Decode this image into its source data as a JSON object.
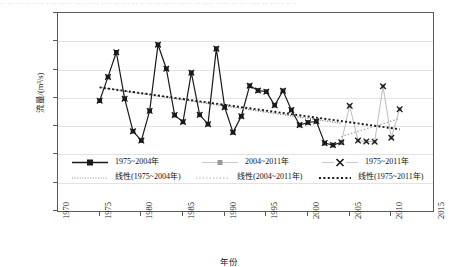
{
  "topstrip": {
    "text": "·· ·· ···  ···· ·· ···· ····· ···· ···· ···· ·· ···  ·· ·· ····· ····· ····· ·· ···· ····· ·· ··· ···· ·· ····· ·· ·"
  },
  "chart_data": {
    "type": "line",
    "title": "",
    "xlabel": "年份",
    "ylabel": "流量/(m³/s)",
    "xlim": [
      1970,
      2015
    ],
    "ylim": [
      0,
      700
    ],
    "xticks": [
      "1970",
      "1975",
      "1980",
      "1985",
      "1990",
      "1995",
      "2000",
      "2005",
      "2010",
      "2015"
    ],
    "yticks": [
      "0",
      "100",
      "200",
      "300",
      "400",
      "500",
      "600",
      "700"
    ],
    "grid": "horizontal",
    "legend_position": "inside-lower-left",
    "colors": {
      "series_1975_2004": "#1a1a1a",
      "series_2004_2011": "#9a9a9a",
      "series_1975_2011": "#1a1a1a",
      "trend_1975_2004": "#6e6e6e",
      "trend_2004_2011": "#9a9a9a",
      "trend_1975_2011": "#1a1a1a",
      "gridline": "#e3e3e3",
      "axis": "#5a5a5a"
    },
    "series": [
      {
        "name": "1975~2004年",
        "marker": "square",
        "color": "#1a1a1a",
        "x": [
          1975,
          1976,
          1977,
          1978,
          1979,
          1980,
          1981,
          1982,
          1983,
          1984,
          1985,
          1986,
          1987,
          1988,
          1989,
          1990,
          1991,
          1992,
          1993,
          1994,
          1995,
          1996,
          1997,
          1998,
          1999,
          2000,
          2001,
          2002,
          2003,
          2004
        ],
        "values": [
          390,
          474,
          561,
          397,
          282,
          249,
          354,
          588,
          503,
          339,
          315,
          489,
          340,
          307,
          574,
          367,
          278,
          335,
          443,
          426,
          422,
          374,
          425,
          357,
          304,
          313,
          317,
          240,
          233,
          243
        ]
      },
      {
        "name": "2004~2011年",
        "marker": "small-square",
        "color": "#9a9a9a",
        "x": [
          2004,
          2005,
          2006,
          2007,
          2008,
          2009,
          2010,
          2011
        ],
        "values": [
          243,
          372,
          249,
          246,
          245,
          441,
          259,
          360
        ]
      },
      {
        "name": "1975~2011年",
        "marker": "x",
        "color": "#1a1a1a",
        "x": [
          1975,
          1976,
          1977,
          1978,
          1979,
          1980,
          1981,
          1982,
          1983,
          1984,
          1985,
          1986,
          1987,
          1988,
          1989,
          1990,
          1991,
          1992,
          1993,
          1994,
          1995,
          1996,
          1997,
          1998,
          1999,
          2000,
          2001,
          2002,
          2003,
          2004,
          2005,
          2006,
          2007,
          2008,
          2009,
          2010,
          2011
        ],
        "values": [
          390,
          474,
          561,
          397,
          282,
          249,
          354,
          588,
          503,
          339,
          315,
          489,
          340,
          307,
          574,
          367,
          278,
          335,
          443,
          426,
          422,
          374,
          425,
          357,
          304,
          313,
          317,
          240,
          233,
          243,
          372,
          249,
          246,
          245,
          441,
          259,
          360
        ]
      }
    ],
    "trendlines": [
      {
        "name": "线性(1975~2004年)",
        "style": "dotted",
        "color": "#6e6e6e",
        "x_start": 1975,
        "y_start": 437,
        "x_end": 2004,
        "y_end": 310
      },
      {
        "name": "线性(2004~2011年)",
        "style": "dotted",
        "color": "#9a9a9a",
        "x_start": 2004,
        "y_start": 263,
        "x_end": 2011,
        "y_end": 327
      },
      {
        "name": "线性(1975~2011年)",
        "style": "dotted-bold",
        "color": "#1a1a1a",
        "x_start": 1975,
        "y_start": 437,
        "x_end": 2011,
        "y_end": 289
      }
    ]
  },
  "legend": {
    "rows": [
      [
        {
          "label": "1975~2004年",
          "glyph": "line-square-marker"
        },
        {
          "label": "2004~2011年",
          "glyph": "gray-small-square-marker"
        },
        {
          "label": "1975~2011年",
          "glyph": "x-marker"
        }
      ],
      [
        {
          "label": "线性(1975~2004年)",
          "glyph": "dotted-line-gray"
        },
        {
          "label": "线性(2004~2011年)",
          "glyph": "dotted-line-light"
        },
        {
          "label": "线性(1975~2011年)",
          "glyph": "dotted-line-bold"
        }
      ]
    ]
  }
}
